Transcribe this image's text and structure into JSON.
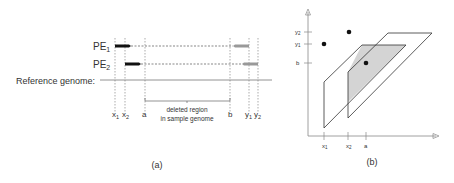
{
  "panel_a": {
    "caption": "(a)",
    "pe1_label": "PE",
    "pe1_sub": "1",
    "pe2_label": "PE",
    "pe2_sub": "2",
    "reference_label": "Reference genome:",
    "x1": "x",
    "x1_sub": "1",
    "x2": "x",
    "x2_sub": "2",
    "a": "a",
    "b": "b",
    "y1": "y",
    "y1_sub": "1",
    "y2": "y",
    "y2_sub": "2",
    "deleted_line1": "deleted region",
    "deleted_line2": "in sample genome"
  },
  "panel_b": {
    "caption": "(b)",
    "y_ticks": [
      {
        "label": "y",
        "sub": "2"
      },
      {
        "label": "y",
        "sub": "1"
      },
      {
        "label": "b",
        "sub": ""
      }
    ],
    "x_ticks": [
      {
        "label": "x",
        "sub": "1"
      },
      {
        "label": "x",
        "sub": "2"
      },
      {
        "label": "a",
        "sub": ""
      }
    ]
  },
  "colors": {
    "read_forward": "#111111",
    "read_reverse": "#999999",
    "line": "#555555",
    "shade": "#d4d4d4"
  }
}
